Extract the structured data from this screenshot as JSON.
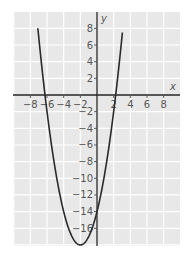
{
  "chart_data": {
    "type": "line",
    "title": "",
    "xlabel": "x",
    "ylabel": "y",
    "function": "y = (x + 2)^2 - 18",
    "xlim": [
      -10,
      10
    ],
    "ylim": [
      -18,
      10
    ],
    "grid": true,
    "x_ticks": [
      -8,
      -6,
      -4,
      -2,
      2,
      4,
      6,
      8
    ],
    "x_tick_labels": [
      "−8",
      "−6",
      "−4",
      "−2",
      "2",
      "4",
      "6",
      "8"
    ],
    "y_ticks": [
      8,
      6,
      4,
      2,
      -2,
      -4,
      -6,
      -8,
      -10,
      -12,
      -14,
      -16
    ],
    "y_tick_labels": [
      "8",
      "6",
      "4",
      "2",
      "−2",
      "−4",
      "−6",
      "−8",
      "−10",
      "−12",
      "−14",
      "−16"
    ],
    "series": [
      {
        "name": "parabola",
        "x": [
          -6.24,
          -6,
          -5,
          -4,
          -3,
          -2,
          -1,
          0,
          1,
          2,
          2.24
        ],
        "values": [
          0,
          -2,
          -9,
          -14,
          -17,
          -18,
          -17,
          -14,
          -9,
          -2,
          0
        ]
      }
    ],
    "key_points": {
      "vertex": [
        -2,
        -18
      ],
      "y_intercept": [
        0,
        -14
      ],
      "roots": [
        -6.24,
        2.24
      ]
    },
    "colors": {
      "background": "#e8e8e8",
      "grid": "#ffffff",
      "axis": "#222222",
      "curve": "#2a2a2a"
    }
  }
}
